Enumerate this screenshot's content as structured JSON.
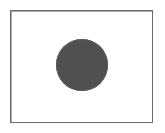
{
  "figure": {
    "title": "",
    "caption": "",
    "background_color": "#ffffff",
    "width": 165,
    "height": 133
  },
  "frame": {
    "label": "",
    "border_color": "#6b6b6b",
    "fill_color": "#ffffff",
    "x": 10,
    "y": 10,
    "width": 143,
    "height": 113,
    "border_width": 1
  },
  "shapes": [
    {
      "type": "circle",
      "label": "",
      "fill_color": "#4f5050",
      "edge_color": "#5a5b5b",
      "center_x": 82,
      "center_y": 65,
      "diameter": 52,
      "radius": 26
    }
  ]
}
